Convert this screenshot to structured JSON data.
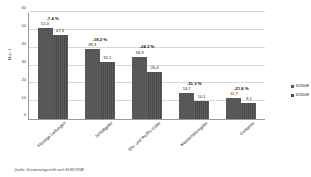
{
  "chart_data": {
    "type": "bar",
    "title": "",
    "xlabel": "",
    "ylabel": "Mio. t",
    "ylim": [
      0,
      60
    ],
    "yticks": [
      0,
      10,
      20,
      30,
      40,
      50,
      60
    ],
    "ytick_labels": [
      "0",
      "10",
      "20",
      "30",
      "40",
      "50",
      "60"
    ],
    "grid": true,
    "legend_position": "right",
    "categories": [
      "Flüssige Ladungen",
      "Schüttgüter",
      "Rlo- und Ro/Ro-Güter",
      "Massenstückgüter",
      "Container"
    ],
    "series": [
      {
        "name": "II/2008",
        "color": "#58585a",
        "values": [
          51.0,
          39.3,
          34.9,
          14.7,
          11.7
        ],
        "value_labels": [
          "51,0",
          "39,3",
          "34,9",
          "14,7",
          "11,7"
        ]
      },
      {
        "name": "II/2009",
        "color": "#4a4a4c",
        "values": [
          47.3,
          32.1,
          26.4,
          10.1,
          9.1
        ],
        "value_labels": [
          "47,3",
          "32,1",
          "26,4",
          "10,1",
          "9,1"
        ]
      }
    ],
    "annotations": [
      "-7,4 %",
      "-18,2 %",
      "-24,3 %",
      "-31,3 %",
      "-21,8 %"
    ]
  },
  "source_note": "Quelle: Zusammengestellt nach EUROSTAT"
}
